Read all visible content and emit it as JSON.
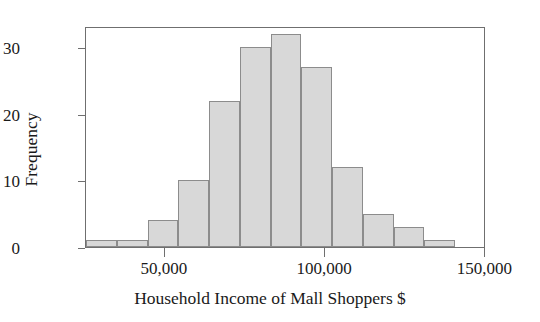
{
  "chart_data": {
    "type": "bar",
    "title": "",
    "subtitle": "",
    "xlabel": "Household Income of Mall Shoppers $",
    "ylabel": "Frequency",
    "grid": false,
    "legend": "none",
    "bin_width": 9600,
    "bin_starts": [
      25400,
      35000,
      44600,
      54200,
      63800,
      73400,
      83000,
      92600,
      102200,
      111800,
      121400,
      131000,
      140600
    ],
    "categories": [
      "25,400-35,000",
      "35,000-44,600",
      "44,600-54,200",
      "54,200-63,800",
      "63,800-73,400",
      "73,400-83,000",
      "83,000-92,600",
      "92,600-102,200",
      "102,200-111,800",
      "111,800-121,400",
      "121,400-131,000",
      "131,000-140,600",
      "140,600-150,200"
    ],
    "values": [
      1,
      1,
      4,
      10,
      22,
      30,
      32,
      27,
      12,
      5,
      3,
      1,
      0
    ],
    "xlim": [
      25400,
      150200
    ],
    "ylim": [
      0,
      33.2
    ],
    "x_ticks": [
      {
        "label": "50,000",
        "value": 50000
      },
      {
        "label": "100,000",
        "value": 100000
      },
      {
        "label": "150,000",
        "value": 150000
      }
    ],
    "y_ticks": [
      {
        "label": "0",
        "value": 0
      },
      {
        "label": "10",
        "value": 10
      },
      {
        "label": "20",
        "value": 20
      },
      {
        "label": "30",
        "value": 30
      }
    ],
    "colors": {
      "bar_fill": "#d8d8d8",
      "bar_stroke": "#8c8c8c",
      "axis": "#6f6f6f",
      "text": "#1a1a1a",
      "background": "#ffffff"
    }
  }
}
